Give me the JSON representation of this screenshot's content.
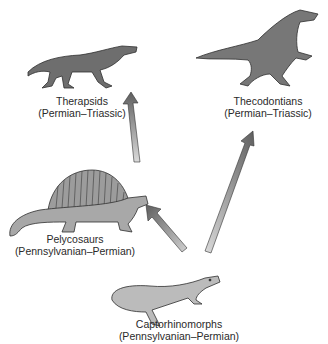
{
  "diagram": {
    "type": "evolutionary-lineage",
    "nodes": [
      {
        "id": "therapsids",
        "name": "Therapsids",
        "period": "(Permian–Triassic)"
      },
      {
        "id": "thecodontians",
        "name": "Thecodontians",
        "period": "(Permian–Triassic)"
      },
      {
        "id": "pelycosaurs",
        "name": "Pelycosaurs",
        "period": "(Pennsylvanian–Permian)"
      },
      {
        "id": "captorhinomorphs",
        "name": "Captorhinomorphs",
        "period": "(Pennsylvanian–Permian)"
      }
    ],
    "edges": [
      {
        "from": "captorhinomorphs",
        "to": "pelycosaurs"
      },
      {
        "from": "captorhinomorphs",
        "to": "thecodontians"
      },
      {
        "from": "pelycosaurs",
        "to": "therapsids"
      }
    ]
  },
  "colors": {
    "dark_animal": "#6e6e6e",
    "light_animal": "#a8a8a8",
    "lizard": "#b9b9b9",
    "arrow_dark": "#6a6a6a",
    "arrow_light": "#d4d4d4",
    "outline": "#2e2e2e"
  }
}
